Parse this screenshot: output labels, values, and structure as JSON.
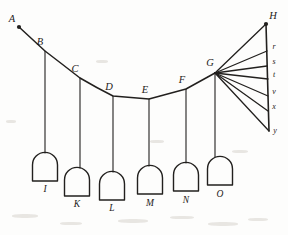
{
  "figure": {
    "ink_color": "#22201e",
    "background_color": "#fdfdfc"
  },
  "chart_data": {
    "type": "diagram",
    "xlabel": "",
    "ylabel": "",
    "xlim": [
      0,
      288
    ],
    "ylim": [
      235,
      0
    ],
    "grid": false,
    "legend": "none",
    "chain_vertices": [
      {
        "label": "A",
        "x": 19,
        "y": 27,
        "label_x": 12,
        "label_y": 22,
        "dot": true
      },
      {
        "label": "B",
        "x": 45,
        "y": 51,
        "label_x": 40,
        "label_y": 45,
        "dot": false
      },
      {
        "label": "C",
        "x": 80,
        "y": 78,
        "label_x": 75,
        "label_y": 72,
        "dot": false
      },
      {
        "label": "D",
        "x": 113,
        "y": 96,
        "label_x": 109,
        "label_y": 90,
        "dot": false
      },
      {
        "label": "E",
        "x": 149,
        "y": 99,
        "label_x": 145,
        "label_y": 93,
        "dot": false
      },
      {
        "label": "F",
        "x": 186,
        "y": 89,
        "label_x": 182,
        "label_y": 83,
        "dot": false
      },
      {
        "label": "G",
        "x": 215,
        "y": 73,
        "label_x": 210,
        "label_y": 66,
        "dot": false
      }
    ],
    "chain_path": "M 19 27 L 45 51 Q 62 64 80 78 Q 97 88 113 96 L 149 99 L 186 89 L 215 73",
    "hangers": [
      {
        "from_label": "B",
        "x": 45,
        "y_top": 51,
        "y_bottom": 153,
        "weight_label": "I"
      },
      {
        "from_label": "C",
        "x": 80,
        "y_top": 78,
        "y_bottom": 168,
        "weight_label": "K"
      },
      {
        "from_label": "D",
        "x": 113,
        "y_top": 96,
        "y_bottom": 172,
        "weight_label": "L"
      },
      {
        "from_label": "E",
        "x": 149,
        "y_top": 99,
        "y_bottom": 166,
        "weight_label": "M"
      },
      {
        "from_label": "F",
        "x": 186,
        "y_top": 89,
        "y_bottom": 163,
        "weight_label": "N"
      },
      {
        "from_label": "G",
        "x": 215,
        "y_top": 73,
        "y_bottom": 157,
        "weight_label": "O"
      }
    ],
    "weights": [
      {
        "label": "I",
        "cx": 45,
        "top": 153,
        "width": 25,
        "height": 28,
        "label_x": 45,
        "label_y": 192
      },
      {
        "label": "K",
        "cx": 77,
        "top": 168,
        "width": 25,
        "height": 28,
        "label_x": 77,
        "label_y": 207
      },
      {
        "label": "L",
        "cx": 112,
        "top": 172,
        "width": 25,
        "height": 28,
        "label_x": 112,
        "label_y": 211
      },
      {
        "label": "M",
        "cx": 150,
        "top": 166,
        "width": 25,
        "height": 28,
        "label_x": 150,
        "label_y": 206
      },
      {
        "label": "N",
        "cx": 186,
        "top": 163,
        "width": 25,
        "height": 28,
        "label_x": 186,
        "label_y": 203
      },
      {
        "label": "O",
        "cx": 220,
        "top": 157,
        "width": 25,
        "height": 28,
        "label_x": 220,
        "label_y": 197
      }
    ],
    "ray_pole": {
      "label": "G",
      "x": 215,
      "y": 73
    },
    "ray_endpoints": [
      {
        "label": "H",
        "x": 266,
        "y": 24,
        "label_x": 273,
        "label_y": 19,
        "dot": true,
        "size": "large"
      },
      {
        "label": "r",
        "x": 267,
        "y": 51,
        "label_x": 274,
        "label_y": 49,
        "dot": false,
        "size": "small"
      },
      {
        "label": "s",
        "x": 267,
        "y": 66,
        "label_x": 274,
        "label_y": 64,
        "dot": false,
        "size": "small"
      },
      {
        "label": "t",
        "x": 268,
        "y": 79,
        "label_x": 274,
        "label_y": 77,
        "dot": false,
        "size": "small"
      },
      {
        "label": "v",
        "x": 268,
        "y": 96,
        "label_x": 274,
        "label_y": 94,
        "dot": false,
        "size": "small"
      },
      {
        "label": "x",
        "x": 268,
        "y": 111,
        "label_x": 274,
        "label_y": 109,
        "dot": false,
        "size": "small"
      },
      {
        "label": "y",
        "x": 269,
        "y": 131,
        "label_x": 275,
        "label_y": 133,
        "dot": false,
        "size": "small"
      }
    ],
    "closing_line": {
      "from": {
        "x": 266,
        "y": 24
      },
      "to": {
        "x": 269,
        "y": 131
      }
    }
  }
}
